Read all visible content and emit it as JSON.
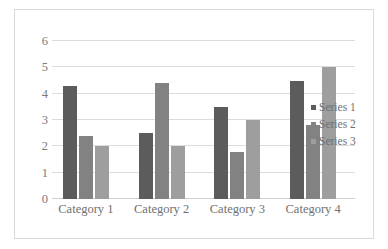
{
  "chart_data": {
    "type": "bar",
    "title": "",
    "subtitle": "",
    "xlabel": "",
    "ylabel": "",
    "categories": [
      "Category 1",
      "Category 2",
      "Category 3",
      "Category 4"
    ],
    "series": [
      {
        "name": "Series 1",
        "values": [
          4.3,
          2.5,
          3.5,
          4.5
        ],
        "color": "#5c5c5c"
      },
      {
        "name": "Series 2",
        "values": [
          2.4,
          4.4,
          1.8,
          2.8
        ],
        "color": "#828282"
      },
      {
        "name": "Series 3",
        "values": [
          2.0,
          2.0,
          3.0,
          5.0
        ],
        "color": "#9e9e9e"
      }
    ],
    "ylim": [
      0,
      6
    ],
    "y_ticks": [
      0,
      1,
      2,
      3,
      4,
      5,
      6
    ],
    "y_tick_labels": [
      "0",
      "1",
      "2",
      "3",
      "4",
      "5",
      "6"
    ],
    "grid": true,
    "grid_axis": "y",
    "legend_position": "right",
    "annotations": []
  },
  "style": {
    "background": "#ffffff",
    "border_color": "#d9d9d9",
    "gridline_color": "#dcdcdc",
    "axis_text_color": "#7a7a7a",
    "legend_text_color": "#6f6f6f"
  }
}
